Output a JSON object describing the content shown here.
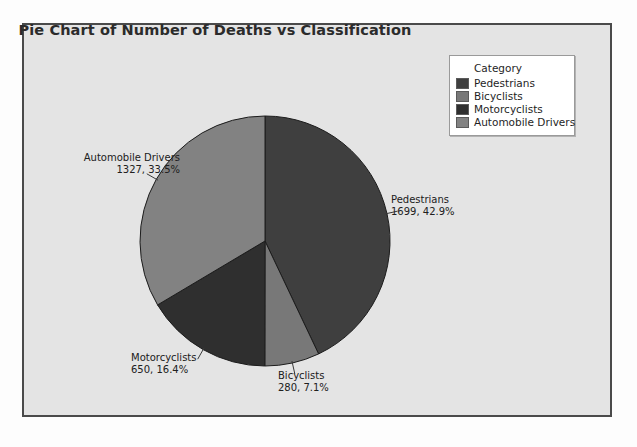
{
  "chart": {
    "title": "Pie Chart of Number of Deaths vs Classification",
    "legend_title": "Category"
  },
  "chart_data": {
    "type": "pie",
    "title": "Pie Chart of Number of Deaths vs Classification",
    "xlabel": "",
    "ylabel": "",
    "legend_title": "Category",
    "legend_position": "top-right",
    "grid": false,
    "total": 3956,
    "start_angle_deg": 0,
    "direction": "clockwise",
    "categories": [
      "Pedestrians",
      "Bicyclists",
      "Motorcyclists",
      "Automobile Drivers"
    ],
    "values": [
      1699,
      280,
      650,
      1327
    ],
    "percents": [
      42.9,
      7.1,
      16.4,
      33.5
    ],
    "colors": [
      "#3f3f3f",
      "#787878",
      "#2f2f2f",
      "#828282"
    ],
    "slices": [
      {
        "name": "Pedestrians",
        "value": 1699,
        "percent": 42.9,
        "color": "#3f3f3f",
        "label_name": "Pedestrians",
        "label_value": "1699, 42.9%"
      },
      {
        "name": "Bicyclists",
        "value": 280,
        "percent": 7.1,
        "color": "#787878",
        "label_name": "Bicyclists",
        "label_value": "280, 7.1%"
      },
      {
        "name": "Motorcyclists",
        "value": 650,
        "percent": 16.4,
        "color": "#2f2f2f",
        "label_name": "Motorcyclists",
        "label_value": "650, 16.4%"
      },
      {
        "name": "Automobile Drivers",
        "value": 1327,
        "percent": 33.5,
        "color": "#828282",
        "label_name": "Automobile Drivers",
        "label_value": "1327, 33.5%"
      }
    ]
  },
  "geometry": {
    "center_x": 265,
    "center_y": 241,
    "radius": 125
  }
}
